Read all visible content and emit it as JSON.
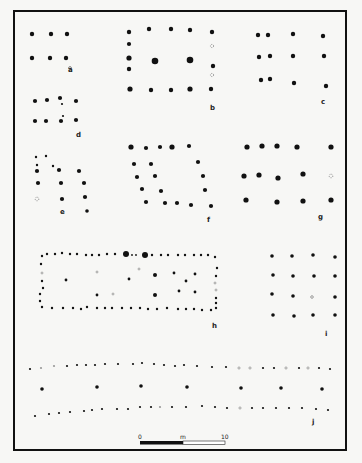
{
  "figure": {
    "panels": [
      {
        "id": "a",
        "label": "a"
      },
      {
        "id": "b",
        "label": "b"
      },
      {
        "id": "c",
        "label": "c"
      },
      {
        "id": "d",
        "label": "d"
      },
      {
        "id": "e",
        "label": "e"
      },
      {
        "id": "f",
        "label": "f"
      },
      {
        "id": "g",
        "label": "g"
      },
      {
        "id": "h",
        "label": "h"
      },
      {
        "id": "i",
        "label": "i"
      },
      {
        "id": "j",
        "label": "j"
      }
    ],
    "scale_bar": {
      "start_label": "0",
      "unit_label": "m",
      "end_label": "10"
    },
    "colors": {
      "ink": "#111111",
      "paper": "#f7f7f5",
      "hollow": "#888888"
    }
  }
}
